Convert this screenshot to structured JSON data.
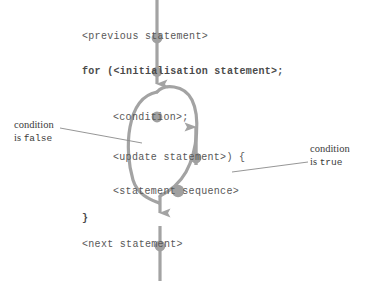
{
  "diagram": {
    "colors": {
      "flow_line": "#9e9e9e",
      "node_dot": "#a0a0a0",
      "code_text": "#585858",
      "annotation_text": "#3b3b3b",
      "background": "#ffffff"
    },
    "code_lines": [
      {
        "id": "previous",
        "text": "<previous statement>"
      },
      {
        "id": "for",
        "text": "for (<initialisation statement>;"
      },
      {
        "id": "condition",
        "text": "<condition>;"
      },
      {
        "id": "update",
        "text": "<update statement>) {"
      },
      {
        "id": "sequence",
        "text": "<statement sequence>"
      },
      {
        "id": "closebrace",
        "text": "}"
      },
      {
        "id": "next",
        "text": "<next statement>"
      }
    ],
    "annotations": {
      "false_branch": {
        "line1": "condition",
        "line2_prefix": "is ",
        "line2_value": "false"
      },
      "true_branch": {
        "line1": "condition",
        "line2_prefix": "is ",
        "line2_value": "true"
      }
    },
    "flow": {
      "entry_arrow": "down",
      "loop_back_arrow": "up",
      "exit_arrow": "down",
      "node_count": 6
    }
  }
}
